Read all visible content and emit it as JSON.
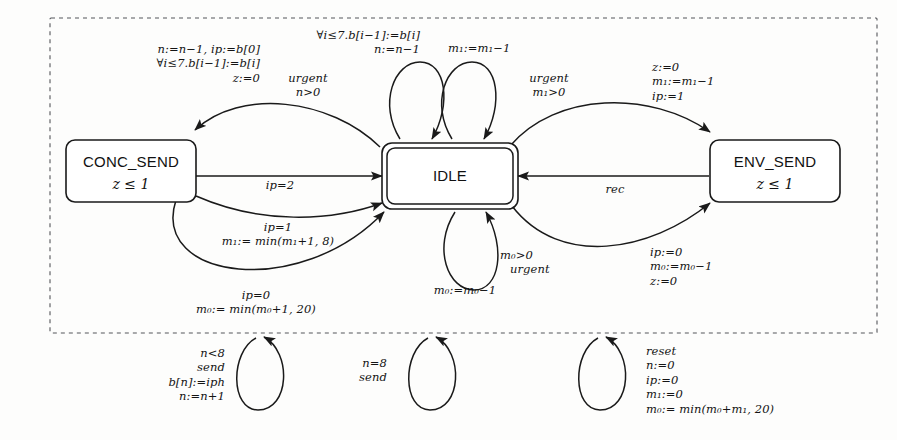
{
  "diagram": {
    "frame": {
      "style": "dashed",
      "label": ""
    },
    "states": [
      {
        "id": "conc_send",
        "name": "CONC_SEND",
        "invariant": "z ≤ 1",
        "initial": false
      },
      {
        "id": "idle",
        "name": "IDLE",
        "invariant": "",
        "initial": true
      },
      {
        "id": "env_send",
        "name": "ENV_SEND",
        "invariant": "z ≤ 1",
        "initial": false
      }
    ],
    "edges": [
      {
        "id": "idle-to-conc",
        "from": "IDLE",
        "to": "CONC_SEND",
        "lines": [
          "n:=n−1, ip:=b[0]",
          "∀i≤7.b[i−1]:=b[i]",
          "z:=0"
        ]
      },
      {
        "id": "idle-loop-n",
        "from": "IDLE",
        "to": "IDLE",
        "lines": [
          "∀i≤7.b[i−1]:=b[i]",
          "n:=n−1"
        ]
      },
      {
        "id": "idle-loop-urgent-n",
        "from": "IDLE",
        "to": "IDLE",
        "lines": [
          "urgent",
          "n>0"
        ]
      },
      {
        "id": "idle-loop-m1",
        "from": "IDLE",
        "to": "IDLE",
        "lines": [
          "m₁:=m₁−1"
        ]
      },
      {
        "id": "idle-loop-urgent-m1",
        "from": "IDLE",
        "to": "IDLE",
        "lines": [
          "urgent",
          "m₁>0"
        ]
      },
      {
        "id": "idle-to-env",
        "from": "IDLE",
        "to": "ENV_SEND",
        "lines": [
          "z:=0",
          "m₁:=m₁−1",
          "ip:=1"
        ]
      },
      {
        "id": "conc-to-idle-ip2",
        "from": "CONC_SEND",
        "to": "IDLE",
        "lines": [
          "ip=2"
        ]
      },
      {
        "id": "conc-to-idle-ip1",
        "from": "CONC_SEND",
        "to": "IDLE",
        "lines": [
          "ip=1",
          "m₁:= min(m₁+1, 8)"
        ]
      },
      {
        "id": "conc-to-idle-ip0",
        "from": "CONC_SEND",
        "to": "IDLE",
        "lines": [
          "ip=0",
          "m₀:= min(m₀+1, 20)"
        ]
      },
      {
        "id": "env-to-idle-rec",
        "from": "ENV_SEND",
        "to": "IDLE",
        "lines": [
          "rec"
        ]
      },
      {
        "id": "idle-loop-m0",
        "from": "IDLE",
        "to": "IDLE",
        "lines": [
          "m₀>0",
          "urgent"
        ]
      },
      {
        "id": "idle-loop-m0-assign",
        "from": "IDLE",
        "to": "IDLE",
        "lines": [
          "m₀:=m₀−1"
        ]
      },
      {
        "id": "idle-to-env-lower",
        "from": "IDLE",
        "to": "ENV_SEND",
        "lines": [
          "ip:=0",
          "m₀:=m₀−1",
          "z:=0"
        ]
      }
    ],
    "outer_loops": [
      {
        "id": "loop-send-n-lt-8",
        "lines": [
          "n<8",
          "send",
          "b[n]:=iph",
          "n:=n+1"
        ],
        "align": "right"
      },
      {
        "id": "loop-send-n-eq-8",
        "lines": [
          "n=8",
          "send"
        ],
        "align": "right"
      },
      {
        "id": "loop-reset",
        "lines": [
          "reset",
          "n:=0",
          "ip:=0",
          "m₁:=0",
          "m₀:= min(m₀+m₁, 20)"
        ],
        "align": "left"
      }
    ],
    "colors": {
      "background": "#fdfdfc",
      "stroke": "#1a1a1a",
      "frame": "#55565a",
      "text": "#141414"
    }
  }
}
